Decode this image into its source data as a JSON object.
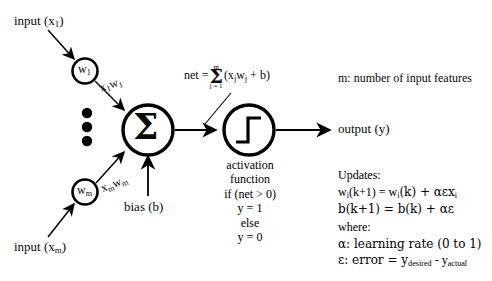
{
  "diagram": {
    "colors": {
      "ink": "#000000",
      "background": "#fefefe"
    },
    "inputs": [
      {
        "label_prefix": "input (x",
        "label_sub": "1",
        "label_suffix": ")"
      },
      {
        "label_prefix": "input (x",
        "label_sub": "m",
        "label_suffix": ")"
      }
    ],
    "weight_nodes": [
      {
        "symbol": "w",
        "sub": "1"
      },
      {
        "symbol": "w",
        "sub": "m"
      }
    ],
    "edge_labels": [
      {
        "x_sym": "x",
        "x_sub": "1",
        "w_sym": "w",
        "w_sub": "1"
      },
      {
        "x_sym": "x",
        "x_sub": "m",
        "w_sym": "w",
        "w_sub": "m"
      }
    ],
    "vertical_dots_count": 3,
    "summation_node": {
      "glyph": "Σ",
      "name": "summation"
    },
    "bias_label": "bias (b)",
    "activation_node": {
      "glyph": "step-function",
      "name": "activation"
    },
    "output_label": "output (y)",
    "net_equation": {
      "lhs": "net =",
      "sum_top": "m",
      "sum_symbol": "Σ",
      "sum_bottom": "j = 1",
      "body_open": "(x",
      "body_j1": "j",
      "body_w": "w",
      "body_j2": "j",
      "body_close": " + b)"
    },
    "activation_caption": {
      "line1": "activation",
      "line2": "function",
      "line3": "if (net > 0)",
      "line4": "y = 1",
      "line5": "else",
      "line6": "y = 0"
    },
    "notes": {
      "m_definition": "m: number of input features",
      "updates_heading": "Updates:",
      "weight_update": {
        "w1": "w",
        "w1_sub": "i",
        "mid": "(k+1) = w",
        "w2_sub": "i",
        "tail": "(k) + αεx",
        "tail_sub": "i"
      },
      "bias_update": "b(k+1) = b(k) + αε",
      "where_heading": "where:",
      "alpha_definition": "α: learning rate (0 to 1)",
      "epsilon_definition": {
        "lead": "ε: error = y",
        "sub1": "desired",
        "mid": " - y",
        "sub2": "actual"
      }
    }
  }
}
